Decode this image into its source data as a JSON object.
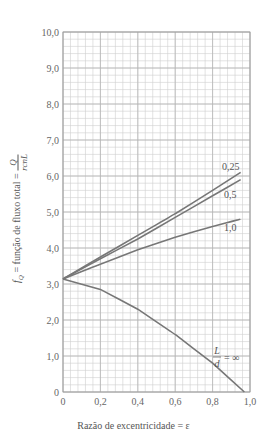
{
  "chart_data": {
    "type": "line",
    "title": "",
    "xlabel": "Razão de excentricidade = ε",
    "ylabel_text": "f_Q = função de fluxo total =",
    "ylabel_fraction": {
      "numerator": "Q",
      "denominator": "rcnL"
    },
    "xlim": [
      0,
      1.0
    ],
    "ylim": [
      0,
      10.0
    ],
    "x_ticks": [
      "0",
      "0,2",
      "0,4",
      "0,6",
      "0,8",
      "1,0"
    ],
    "y_ticks": [
      "0",
      "1,0",
      "2,0",
      "3,0",
      "4,0",
      "5,0",
      "6,0",
      "7,0",
      "8,0",
      "9,0",
      "10,0"
    ],
    "grid": true,
    "x": [
      0,
      0.2,
      0.4,
      0.6,
      0.8,
      0.95
    ],
    "series": [
      {
        "name": "L/d = 0,25",
        "label": "0,25",
        "x": [
          0,
          0.2,
          0.4,
          0.6,
          0.8,
          0.95
        ],
        "values": [
          3.14,
          3.75,
          4.35,
          4.95,
          5.6,
          6.1
        ]
      },
      {
        "name": "L/d = 0,5",
        "label": "0,5",
        "x": [
          0,
          0.2,
          0.4,
          0.6,
          0.8,
          0.95
        ],
        "values": [
          3.14,
          3.7,
          4.25,
          4.85,
          5.45,
          5.9
        ]
      },
      {
        "name": "L/d = 1,0",
        "label": "1,0",
        "x": [
          0,
          0.2,
          0.4,
          0.6,
          0.8,
          0.95
        ],
        "values": [
          3.14,
          3.55,
          3.95,
          4.3,
          4.6,
          4.8
        ]
      },
      {
        "name": "L/d = ∞",
        "label": "L/d = ∞",
        "x": [
          0,
          0.2,
          0.4,
          0.6,
          0.8,
          0.97
        ],
        "values": [
          3.14,
          2.85,
          2.3,
          1.6,
          0.8,
          0.0
        ]
      }
    ],
    "annotations": [
      "0,25",
      "0,5",
      "1,0",
      "L/d = ∞"
    ]
  },
  "labels": {
    "ylabel_prefix": "f",
    "ylabel_sub": "Q",
    "ylabel_text": " = função de fluxo total = ",
    "num": "Q",
    "den": "rcnL",
    "xlabel": "Razão de excentricidade = ε",
    "ld_num": "L",
    "ld_den": "d",
    "ld_eq": "= ∞"
  }
}
